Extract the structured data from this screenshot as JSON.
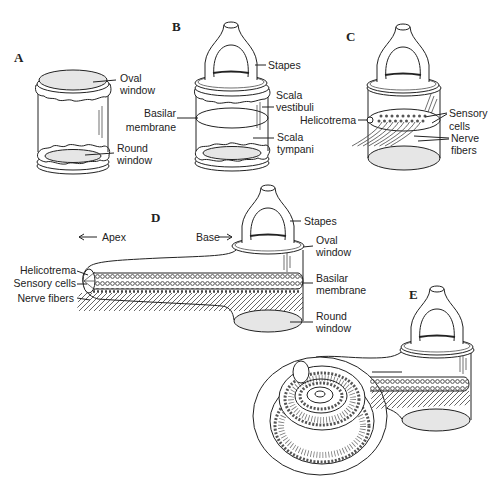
{
  "figure": {
    "colors": {
      "line": "#222222",
      "membrane_fill": "#e6e6e6",
      "cells": "#555555",
      "background": "#ffffff"
    }
  },
  "panel_a": {
    "letter": "A",
    "oval_window": {
      "line1": "Oval",
      "line2": "window"
    },
    "round_window": {
      "line1": "Round",
      "line2": "window"
    }
  },
  "panel_b": {
    "letter": "B",
    "stapes": "Stapes",
    "scala_vestibuli": {
      "line1": "Scala",
      "line2": "vestibuli"
    },
    "basilar_membrane": {
      "line1": "Basilar",
      "line2": "membrane"
    },
    "scala_tympani": {
      "line1": "Scala",
      "line2": "tympani"
    }
  },
  "panel_c": {
    "letter": "C",
    "helicotrema": "Helicotrema",
    "sensory_cells": {
      "line1": "Sensory",
      "line2": "cells"
    },
    "nerve_fibers": {
      "line1": "Nerve",
      "line2": "fibers"
    }
  },
  "panel_d": {
    "letter": "D",
    "apex": "Apex",
    "base": "Base",
    "stapes": "Stapes",
    "oval_window": {
      "line1": "Oval",
      "line2": "window"
    },
    "basilar_membrane": {
      "line1": "Basilar",
      "line2": "membrane"
    },
    "round_window": {
      "line1": "Round",
      "line2": "window"
    },
    "helicotrema": "Helicotrema",
    "sensory_cells": "Sensory cells",
    "nerve_fibers": "Nerve fibers"
  },
  "panel_e": {
    "letter": "E"
  }
}
